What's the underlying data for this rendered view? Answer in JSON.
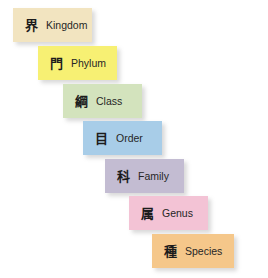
{
  "diagram": {
    "background_color": "#ffffff",
    "ranks": [
      {
        "kanji": "界",
        "label": "Kingdom",
        "color": "#f2e4c0",
        "x": 13,
        "y": 8,
        "width": 79,
        "height": 34,
        "pad_left": 11
      },
      {
        "kanji": "門",
        "label": "Phylum",
        "color": "#f7f073",
        "x": 38,
        "y": 46,
        "width": 79,
        "height": 34,
        "pad_left": 11
      },
      {
        "kanji": "綱",
        "label": "Class",
        "color": "#d3e3bd",
        "x": 63,
        "y": 84,
        "width": 79,
        "height": 34,
        "pad_left": 11
      },
      {
        "kanji": "目",
        "label": "Order",
        "color": "#a8cde8",
        "x": 83,
        "y": 121,
        "width": 79,
        "height": 34,
        "pad_left": 11
      },
      {
        "kanji": "科",
        "label": "Family",
        "color": "#c3bcd2",
        "x": 105,
        "y": 159,
        "width": 79,
        "height": 34,
        "pad_left": 11
      },
      {
        "kanji": "属",
        "label": "Genus",
        "color": "#f3c3d5",
        "x": 129,
        "y": 196,
        "width": 79,
        "height": 34,
        "pad_left": 11
      },
      {
        "kanji": "種",
        "label": "Species",
        "color": "#f5c78a",
        "x": 152,
        "y": 234,
        "width": 82,
        "height": 34,
        "pad_left": 11
      }
    ]
  }
}
